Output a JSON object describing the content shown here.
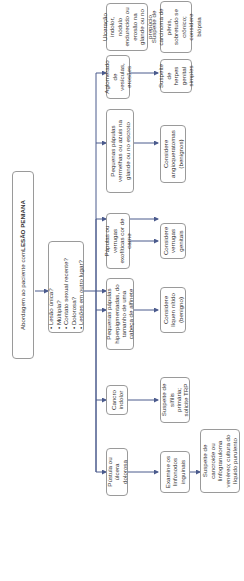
{
  "diagram": {
    "title_prefix": "Abordagem ao paciente com ",
    "title_bold": "LESÃO PENIANA",
    "questions": [
      "Lesão única?",
      "Múltipla?",
      "Contato sexual recente?",
      "Dolorosa?",
      "Lesões em outro lugar?"
    ],
    "branches": [
      {
        "finding": "Pústula ou úlcera dolorosa",
        "step2": "Examine os linfonodos inguinais",
        "step3": "Suspeite de cancroide ou linfogranuloma venéreo; cultura do líquido purulento"
      },
      {
        "finding": "Cancro indolor",
        "step2": "Suspeite de sífilis primária; solicite TRP"
      },
      {
        "finding": "Pequenas pápulas hiperpigmentadas, do tamanho de uma cabeça de alfinete",
        "step2": "Considere líquen nítido (benigno)"
      },
      {
        "finding": "Pápulas ou verrugas exofíticas cor de carne",
        "step2": "Considere verrugas genitais"
      },
      {
        "finding": "Pequenas pápulas vermelhas ou azuis na glande ou no escroto",
        "step2": "Considere angioqueratomas (benignos)"
      },
      {
        "finding": "Aglomerado de vesículas, erosões",
        "step2": "Suspeite de herpes genital simples"
      },
      {
        "finding": "Ulceração indolor, nódulo endurecido ou erosão na glande ou no prepúcio",
        "step2": "Suspeite de carcinoma de pênis, sobretudo se crônico; considere biópsia"
      }
    ],
    "colors": {
      "arrow": "#4a5a8c",
      "border": "#9a9a9a"
    }
  }
}
